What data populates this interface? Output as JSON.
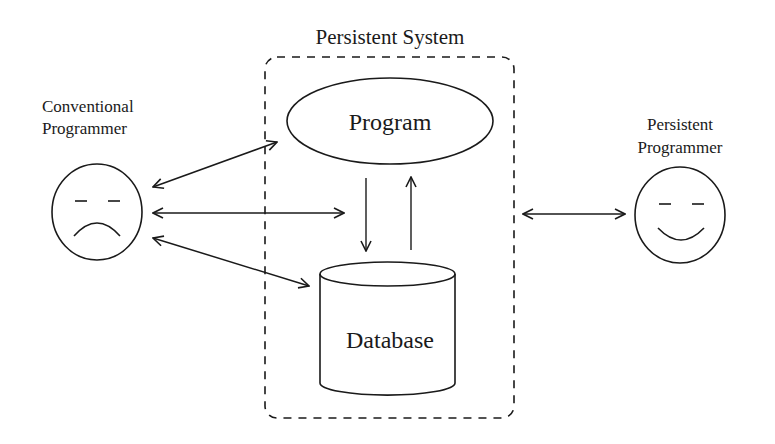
{
  "diagram": {
    "system": {
      "title": "Persistent System"
    },
    "nodes": {
      "program": {
        "label": "Program",
        "shape": "ellipse"
      },
      "database": {
        "label": "Database",
        "shape": "cylinder"
      }
    },
    "actors": {
      "conventional": {
        "line1": "Conventional",
        "line2": "Programmer",
        "face": "sad-face-icon"
      },
      "persistent": {
        "line1": "Persistent",
        "line2": "Programmer",
        "face": "happy-face-icon"
      }
    },
    "edges": [
      {
        "from": "Conventional Programmer",
        "to": "Program",
        "type": "bidirectional"
      },
      {
        "from": "Conventional Programmer",
        "to": "Persistent System",
        "type": "bidirectional"
      },
      {
        "from": "Conventional Programmer",
        "to": "Database",
        "type": "bidirectional"
      },
      {
        "from": "Program",
        "to": "Database",
        "type": "directed"
      },
      {
        "from": "Database",
        "to": "Program",
        "type": "directed"
      },
      {
        "from": "Persistent System",
        "to": "Persistent Programmer",
        "type": "bidirectional"
      }
    ],
    "colors": {
      "stroke": "#1a1a1a",
      "background": "#ffffff"
    }
  }
}
